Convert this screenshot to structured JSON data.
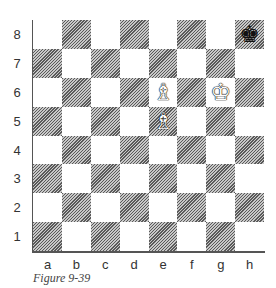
{
  "board": {
    "ranks": [
      "8",
      "7",
      "6",
      "5",
      "4",
      "3",
      "2",
      "1"
    ],
    "files": [
      "a",
      "b",
      "c",
      "d",
      "e",
      "f",
      "g",
      "h"
    ],
    "pieces": [
      {
        "square": "h8",
        "color": "black",
        "type": "king",
        "glyph": "♚",
        "icon": "black-king-icon"
      },
      {
        "square": "g6",
        "color": "white",
        "type": "king",
        "glyph": "♔",
        "icon": "white-king-icon"
      },
      {
        "square": "e6",
        "color": "white",
        "type": "bishop",
        "glyph": "♗",
        "icon": "white-bishop-icon"
      },
      {
        "square": "e5",
        "color": "white",
        "type": "bishop",
        "glyph": "♗",
        "icon": "white-bishop-icon"
      }
    ],
    "colors": {
      "light_square": "#ffffff",
      "dark_square_hatch": "#5a5a5a",
      "border": "#555555"
    }
  },
  "caption": "Figure 9-39"
}
